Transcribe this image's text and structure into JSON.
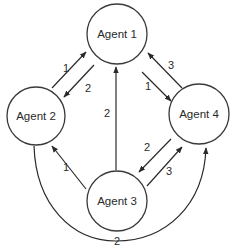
{
  "diagram": {
    "type": "directed-graph",
    "colors": {
      "stroke": "#2a2a2a",
      "background": "#ffffff",
      "node_fill": "#ffffff"
    },
    "nodes": [
      {
        "id": "agent1",
        "label": "Agent 1",
        "cx": 117,
        "cy": 34,
        "r": 30
      },
      {
        "id": "agent2",
        "label": "Agent 2",
        "cx": 36,
        "cy": 116,
        "r": 29
      },
      {
        "id": "agent3",
        "label": "Agent 3",
        "cx": 117,
        "cy": 201,
        "r": 30
      },
      {
        "id": "agent4",
        "label": "Agent 4",
        "cx": 199,
        "cy": 114,
        "r": 30
      }
    ],
    "edges": [
      {
        "from": "Agent 2",
        "to": "Agent 1",
        "label": "1",
        "x1": 52,
        "y1": 88,
        "x2": 86,
        "y2": 52,
        "lx": 63,
        "ly": 72
      },
      {
        "from": "Agent 1",
        "to": "Agent 2",
        "label": "2",
        "x1": 94,
        "y1": 65,
        "x2": 64,
        "y2": 97,
        "lx": 85,
        "ly": 92
      },
      {
        "from": "Agent 1",
        "to": "Agent 4",
        "label": "1",
        "x1": 142,
        "y1": 72,
        "x2": 171,
        "y2": 101,
        "lx": 145,
        "ly": 90
      },
      {
        "from": "Agent 4",
        "to": "Agent 1",
        "label": "3",
        "x1": 182,
        "y1": 88,
        "x2": 148,
        "y2": 53,
        "lx": 168,
        "ly": 69
      },
      {
        "from": "Agent 3",
        "to": "Agent 1",
        "label": "2",
        "x1": 116,
        "y1": 170,
        "x2": 116,
        "y2": 67,
        "lx": 104,
        "ly": 117
      },
      {
        "from": "Agent 3",
        "to": "Agent 2",
        "label": "1",
        "x1": 86,
        "y1": 189,
        "x2": 52,
        "y2": 146,
        "lx": 63,
        "ly": 171
      },
      {
        "from": "Agent 4",
        "to": "Agent 3",
        "label": "2",
        "x1": 171,
        "y1": 139,
        "x2": 139,
        "y2": 172,
        "lx": 144,
        "ly": 151
      },
      {
        "from": "Agent 3",
        "to": "Agent 4",
        "label": "3",
        "x1": 147,
        "y1": 186,
        "x2": 182,
        "y2": 147,
        "lx": 166,
        "ly": 175
      }
    ],
    "curved_edge": {
      "from": "Agent 2",
      "to": "Agent 4",
      "label": "2",
      "lx": 114,
      "ly": 245
    }
  }
}
